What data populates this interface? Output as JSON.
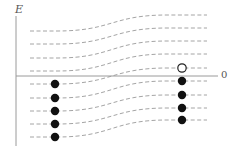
{
  "labels": {
    "y_axis": "E",
    "x_axis_origin": "0"
  },
  "colors": {
    "axis": "#9a9a9a",
    "dashed_line": "#9a9a9a",
    "filled_dot": "#111111",
    "open_dot_stroke": "#222222",
    "background": "#ffffff"
  },
  "geometry": {
    "axis_x": 16,
    "axis_top": 16,
    "axis_bottom": 146,
    "zero_y": 76,
    "zero_line_end": 218,
    "line_start_x": 30,
    "line_end_x": 207,
    "transition_center_x": 112,
    "transition_half_width": 55,
    "left_dot_x": 55,
    "right_dot_x": 182,
    "dot_radius": 4.2
  },
  "levels": [
    {
      "left_y": 31,
      "right_y": 15,
      "left_state": "none",
      "right_state": "none"
    },
    {
      "left_y": 44,
      "right_y": 28,
      "left_state": "none",
      "right_state": "none"
    },
    {
      "left_y": 58,
      "right_y": 41,
      "left_state": "none",
      "right_state": "none"
    },
    {
      "left_y": 71,
      "right_y": 54,
      "left_state": "none",
      "right_state": "none"
    },
    {
      "left_y": 84,
      "right_y": 68,
      "left_state": "filled",
      "right_state": "open"
    },
    {
      "left_y": 98,
      "right_y": 81,
      "left_state": "filled",
      "right_state": "filled"
    },
    {
      "left_y": 111,
      "right_y": 95,
      "left_state": "filled",
      "right_state": "filled"
    },
    {
      "left_y": 124,
      "right_y": 108,
      "left_state": "filled",
      "right_state": "filled"
    },
    {
      "left_y": 137,
      "right_y": 120,
      "left_state": "filled",
      "right_state": "filled"
    }
  ],
  "legend_semantics": {
    "filled_dot": "occupied state",
    "open_dot": "empty state (hole)"
  }
}
